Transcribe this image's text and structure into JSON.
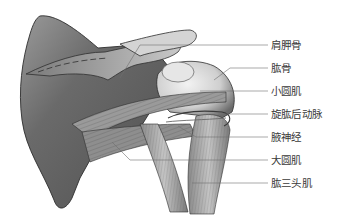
{
  "figure": {
    "colors": {
      "bone_dark": "#5a5a5a",
      "bone_mid": "#8c8c8c",
      "bone_light": "#d9d9d9",
      "outline": "#2e2e2e",
      "leader_line": "#6e6e6e",
      "label_text": "#3a3a3a"
    }
  },
  "labels": [
    {
      "text": "肩胛骨",
      "y": 45,
      "target_x": 130,
      "target_y": 75
    },
    {
      "text": "肱骨",
      "y": 68,
      "target_x": 215,
      "target_y": 80
    },
    {
      "text": "小圆肌",
      "y": 91,
      "target_x": 195,
      "target_y": 91
    },
    {
      "text": "旋肱后动脉",
      "y": 114,
      "target_x": 180,
      "target_y": 120
    },
    {
      "text": "腋神经",
      "y": 137,
      "target_x": 175,
      "target_y": 128
    },
    {
      "text": "大圆肌",
      "y": 160,
      "target_x": 115,
      "target_y": 140
    },
    {
      "text": "肱三头肌",
      "y": 183,
      "target_x": 185,
      "target_y": 185
    }
  ]
}
